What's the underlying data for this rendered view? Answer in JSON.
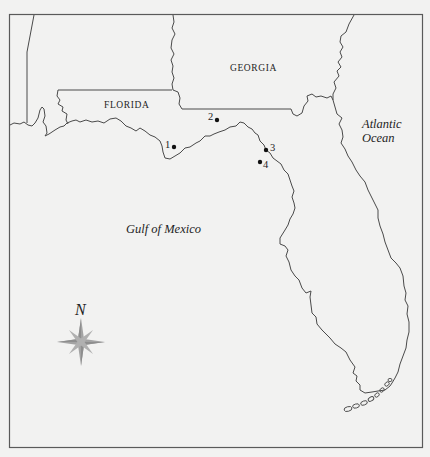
{
  "map": {
    "labels": {
      "florida": "FLORIDA",
      "georgia": "GEORGIA",
      "atlantic_line1": "Atlantic",
      "atlantic_line2": "Ocean",
      "gulf": "Gulf of Mexico"
    },
    "sites": [
      {
        "number": "1"
      },
      {
        "number": "2"
      },
      {
        "number": "3"
      },
      {
        "number": "4"
      }
    ],
    "compass": {
      "north_label": "N",
      "icon": "compass-rose-icon"
    },
    "colors": {
      "background": "#f2f2f1",
      "line": "#4a4a4a",
      "compass": "#9a9a9a",
      "text": "#1e1e1e"
    }
  }
}
